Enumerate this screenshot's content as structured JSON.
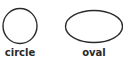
{
  "shapes": [
    {
      "name": "circle",
      "label": "circle",
      "stroke": "#2b2b2b"
    },
    {
      "name": "oval",
      "label": "oval",
      "stroke": "#2b2b2b"
    }
  ]
}
